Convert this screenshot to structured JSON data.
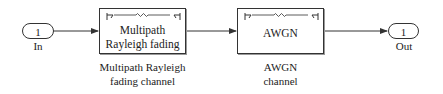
{
  "diagram": {
    "type": "simulink-model",
    "input_port": {
      "number": "1",
      "label": "In"
    },
    "output_port": {
      "number": "1",
      "label": "Out"
    },
    "blocks": [
      {
        "title_line1": "Multipath",
        "title_line2": "Rayleigh fading",
        "caption_line1": "Multipath Rayleigh",
        "caption_line2": "fading channel",
        "icon": "channel-antenna-icon"
      },
      {
        "title_line1": "AWGN",
        "caption_line1": "AWGN",
        "caption_line2": "channel",
        "icon": "channel-antenna-icon"
      }
    ],
    "connections": [
      {
        "from": "In",
        "to": "Multipath Rayleigh fading channel"
      },
      {
        "from": "Multipath Rayleigh fading channel",
        "to": "AWGN channel"
      },
      {
        "from": "AWGN channel",
        "to": "Out"
      }
    ],
    "colors": {
      "line": "#333333",
      "background": "#ffffff"
    }
  }
}
